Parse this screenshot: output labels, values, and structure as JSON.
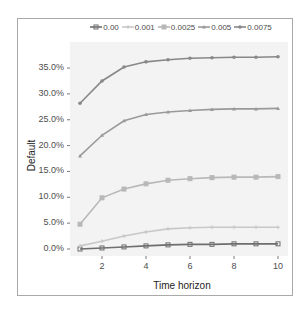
{
  "chart_data": {
    "type": "line",
    "title": "",
    "xlabel": "Time horizon",
    "ylabel": "Default",
    "x": [
      1,
      2,
      3,
      4,
      5,
      6,
      7,
      8,
      9,
      10
    ],
    "x_ticks": [
      "2",
      "4",
      "6",
      "8",
      "10"
    ],
    "y_ticks": [
      "0.0%",
      "5.0%",
      "10.0%",
      "15.0%",
      "20.0%",
      "25.0%",
      "30.0%",
      "35.0%"
    ],
    "ylim": [
      0,
      37.5
    ],
    "grid": false,
    "legend_position": "top",
    "series": [
      {
        "name": "0.00",
        "color": "#6e6e6e",
        "marker": "square-cross",
        "values": [
          0.0,
          0.2,
          0.4,
          0.6,
          0.8,
          0.9,
          0.9,
          1.0,
          1.0,
          1.0
        ]
      },
      {
        "name": "0.001",
        "color": "#c8c8c8",
        "marker": "plus",
        "values": [
          0.6,
          1.5,
          2.5,
          3.3,
          3.9,
          4.1,
          4.2,
          4.2,
          4.2,
          4.2
        ]
      },
      {
        "name": "0.0025",
        "color": "#b8b8b8",
        "marker": "square",
        "values": [
          4.8,
          9.9,
          11.6,
          12.6,
          13.3,
          13.6,
          13.8,
          13.9,
          13.9,
          14.0
        ]
      },
      {
        "name": "0.005",
        "color": "#9a9a9a",
        "marker": "triangle",
        "values": [
          18.0,
          22.0,
          24.8,
          26.0,
          26.5,
          26.8,
          27.0,
          27.1,
          27.1,
          27.2
        ]
      },
      {
        "name": "0.0075",
        "color": "#888888",
        "marker": "circle",
        "values": [
          28.2,
          32.5,
          35.2,
          36.2,
          36.6,
          36.9,
          37.0,
          37.1,
          37.1,
          37.2
        ]
      }
    ]
  }
}
